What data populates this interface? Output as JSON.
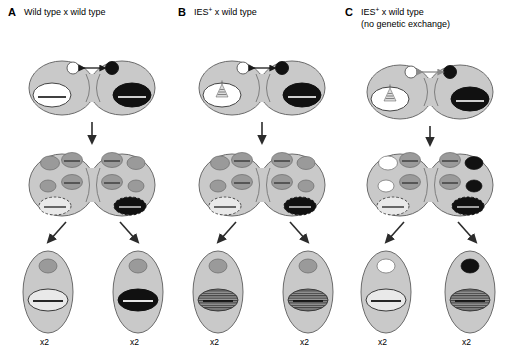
{
  "figure": {
    "width": 510,
    "height": 358,
    "background": "#ffffff",
    "cell_fill": "#c9c9c9",
    "cell_stroke": "#6b6b6b",
    "mac_dark": "#111111",
    "mac_light": "#ffffff",
    "nucleus_gray": "#9a9a9a",
    "arrow_color": "#2b2b2b"
  },
  "panels": [
    {
      "letter": "A",
      "title_parts": [
        "Wild type",
        "x",
        "wild type"
      ],
      "title": "Wild type  x  wild type",
      "subtitle": "",
      "left_offspring_label": "x2",
      "right_offspring_label": "x2",
      "rows": [
        {
          "name": "conjugation",
          "left_cell": {
            "mac": "light",
            "mic": "light",
            "has_ies_bands": false
          },
          "right_cell": {
            "mac": "dark",
            "mic": "dark",
            "has_ies_bands": false
          },
          "exchange_arrow": "double-headed"
        },
        {
          "name": "development",
          "left_cell": {
            "new_mac_count": 3,
            "old_mac": "dashed-light"
          },
          "right_cell": {
            "new_mac_count": 3,
            "old_mac": "dashed-dark"
          }
        },
        {
          "name": "progeny",
          "left_cell": {
            "mac": "light-with-band",
            "mic": "gray"
          },
          "right_cell": {
            "mac": "dark-with-band",
            "mic": "gray"
          }
        }
      ]
    },
    {
      "letter": "B",
      "title_parts": [
        "IES",
        "+",
        "x",
        "wild type"
      ],
      "title": "IES+  x  wild type",
      "subtitle": "",
      "left_offspring_label": "x2",
      "right_offspring_label": "x2",
      "rows": [
        {
          "name": "conjugation",
          "left_cell": {
            "mac": "light-with-ies-signal",
            "mic": "light",
            "has_ies_bands": true
          },
          "right_cell": {
            "mac": "dark",
            "mic": "dark",
            "has_ies_bands": false
          },
          "exchange_arrow": "double-headed"
        },
        {
          "name": "development",
          "left_cell": {
            "new_mac_count": 3,
            "old_mac": "dashed-light"
          },
          "right_cell": {
            "new_mac_count": 3,
            "old_mac": "dashed-dark"
          }
        },
        {
          "name": "progeny",
          "left_cell": {
            "mac": "striped-with-band",
            "mic": "gray"
          },
          "right_cell": {
            "mac": "striped-with-band",
            "mic": "gray"
          }
        }
      ]
    },
    {
      "letter": "C",
      "title_parts": [
        "IES",
        "+",
        "x",
        "wild type"
      ],
      "title": "IES+  x  wild type",
      "subtitle": "(no genetic exchange)",
      "left_offspring_label": "x2",
      "right_offspring_label": "x2",
      "rows": [
        {
          "name": "conjugation",
          "left_cell": {
            "mac": "light-with-ies-signal",
            "mic": "light",
            "has_ies_bands": true
          },
          "right_cell": {
            "mac": "dark",
            "mic": "dark",
            "has_ies_bands": false
          },
          "exchange_arrow": "double-headed-blocked"
        },
        {
          "name": "development",
          "left_cell": {
            "new_mac_count": 3,
            "old_mac": "dashed-light"
          },
          "right_cell": {
            "new_mac_count": 3,
            "old_mac": "dashed-dark"
          }
        },
        {
          "name": "progeny",
          "left_cell": {
            "mac": "light-plain",
            "mic": "gray"
          },
          "right_cell": {
            "mac": "dark-plain",
            "mic": "gray"
          }
        }
      ]
    }
  ]
}
